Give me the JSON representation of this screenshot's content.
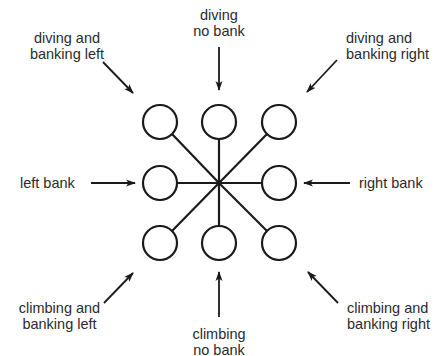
{
  "diagram": {
    "type": "control-stick-positions",
    "colors": {
      "stroke": "#1a1a1a",
      "text": "#2b2b2b",
      "background": "#ffffff"
    },
    "labels": {
      "diving_banking_left": {
        "line1": "diving and",
        "line2": "banking left"
      },
      "diving_no_bank": {
        "line1": "diving",
        "line2": "no bank"
      },
      "diving_banking_right": {
        "line1": "diving and",
        "line2": "banking right"
      },
      "left_bank": {
        "line1": "left bank"
      },
      "right_bank": {
        "line1": "right bank"
      },
      "climbing_banking_left": {
        "line1": "climbing and",
        "line2": "banking left"
      },
      "climbing_no_bank": {
        "line1": "climbing",
        "line2": "no bank"
      },
      "climbing_banking_right": {
        "line1": "climbing and",
        "line2": "banking right"
      }
    },
    "grid": {
      "rows": 3,
      "cols": 3,
      "center_node": "hub (no circle)",
      "positions": [
        "diving-banking-left",
        "diving-no-bank",
        "diving-banking-right",
        "left-bank",
        "neutral",
        "right-bank",
        "climbing-banking-left",
        "climbing-no-bank",
        "climbing-banking-right"
      ]
    }
  }
}
